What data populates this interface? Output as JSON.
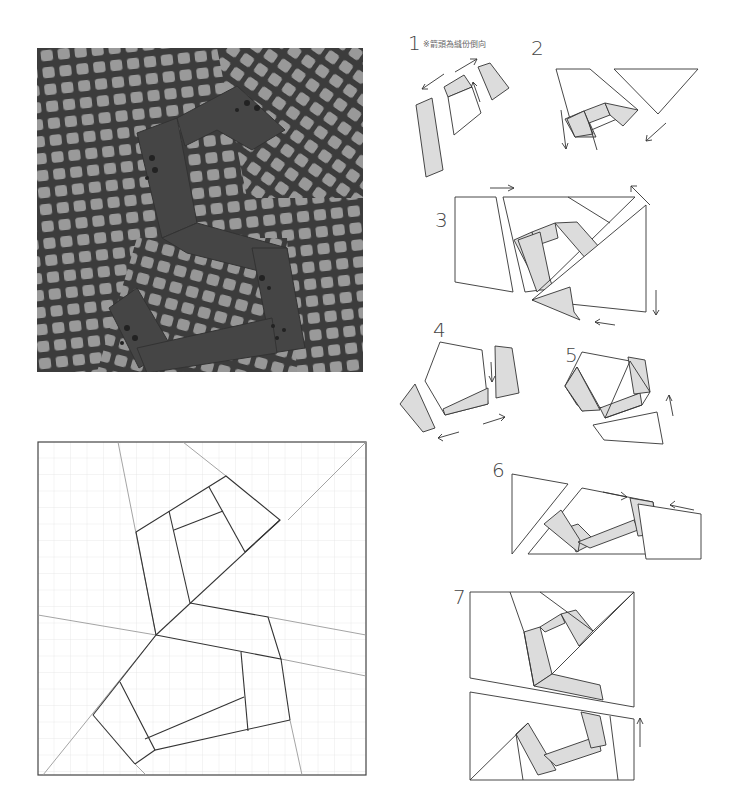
{
  "figure": {
    "photo": {
      "alt": "Finished quilt block photo showing letter S in dark floral fabric on a grey checked background"
    },
    "pattern": {
      "alt": "Full-size pattern template with grid and seam lines"
    }
  },
  "steps": [
    {
      "num": "1",
      "note": "※箭頭為縫份倒向"
    },
    {
      "num": "2"
    },
    {
      "num": "3"
    },
    {
      "num": "4"
    },
    {
      "num": "5"
    },
    {
      "num": "6"
    },
    {
      "num": "7"
    }
  ],
  "colors": {
    "fill_shaded": "#dcdcdc",
    "stroke": "#333333",
    "grid": "#e6e6e6",
    "guide": "#9a9a9a",
    "photo_bg": "#8c8c8c",
    "photo_dark": "#3a3a3a"
  }
}
